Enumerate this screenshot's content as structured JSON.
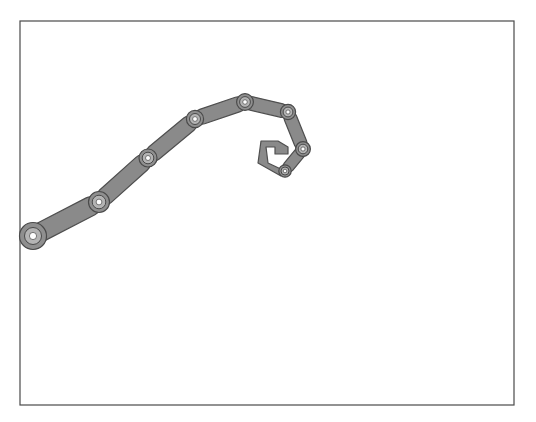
{
  "canvas": {
    "width": 536,
    "height": 422,
    "background_color": "#ffffff",
    "label": "robot-arm-viewport"
  },
  "frame": {
    "name": "viewport-border",
    "x": 20,
    "y": 21,
    "width": 494,
    "height": 384,
    "stroke_color": "#4a4a4a",
    "stroke_width": 1.2,
    "fill_color": "#ffffff"
  },
  "style": {
    "link_fill": "#8a8a8a",
    "link_stroke": "#4f4f4f",
    "link_stroke_width": 1.2,
    "joint_outer_fill": "#8f8f8f",
    "joint_outer_stroke": "#4a4a4a",
    "joint_mid_fill": "#b4b4b4",
    "joint_hub_fill": "#ffffff",
    "joint_hub_stroke": "#5a5a5a",
    "gripper_fill": "#8a8a8a",
    "gripper_stroke": "#4f4f4f"
  },
  "mechanism": {
    "name": "serial-robot-arm",
    "type": "planar articulated linkage",
    "link_half_width": 7.5,
    "joint_count": 8,
    "joints": [
      {
        "id": "joint-base",
        "label": "J0",
        "x": 33,
        "y": 236,
        "outer_r": 13.5,
        "mid_r": 8.5,
        "hub_r": 3.6
      },
      {
        "id": "joint-1",
        "label": "J1",
        "x": 99,
        "y": 202,
        "outer_r": 10.5,
        "mid_r": 6.8,
        "hub_r": 2.9
      },
      {
        "id": "joint-2",
        "label": "J2",
        "x": 148,
        "y": 158,
        "outer_r": 9.0,
        "mid_r": 5.8,
        "hub_r": 2.5
      },
      {
        "id": "joint-3",
        "label": "J3",
        "x": 195,
        "y": 119,
        "outer_r": 8.6,
        "mid_r": 5.5,
        "hub_r": 2.4
      },
      {
        "id": "joint-4-apex",
        "label": "J4",
        "x": 245,
        "y": 102,
        "outer_r": 8.4,
        "mid_r": 5.4,
        "hub_r": 2.3
      },
      {
        "id": "joint-5",
        "label": "J5",
        "x": 288,
        "y": 112,
        "outer_r": 7.6,
        "mid_r": 4.9,
        "hub_r": 2.1
      },
      {
        "id": "joint-6",
        "label": "J6",
        "x": 303,
        "y": 149,
        "outer_r": 7.4,
        "mid_r": 4.8,
        "hub_r": 2.1
      },
      {
        "id": "joint-7-wrist",
        "label": "J7",
        "x": 285,
        "y": 171,
        "outer_r": 6.2,
        "mid_r": 4.0,
        "hub_r": 1.8
      }
    ],
    "links": [
      {
        "id": "link-0",
        "label": "L0",
        "from": "joint-base",
        "to": "joint-1",
        "half_width": 9.5
      },
      {
        "id": "link-1",
        "label": "L1",
        "from": "joint-1",
        "to": "joint-2",
        "half_width": 8.5
      },
      {
        "id": "link-2",
        "label": "L2",
        "from": "joint-2",
        "to": "joint-3",
        "half_width": 8.0
      },
      {
        "id": "link-3",
        "label": "L3",
        "from": "joint-3",
        "to": "joint-4-apex",
        "half_width": 7.6
      },
      {
        "id": "link-4",
        "label": "L4",
        "from": "joint-4-apex",
        "to": "joint-5",
        "half_width": 6.8
      },
      {
        "id": "link-5",
        "label": "L5",
        "from": "joint-5",
        "to": "joint-6",
        "half_width": 6.4
      },
      {
        "id": "link-6",
        "label": "L6",
        "from": "joint-6",
        "to": "joint-7-wrist",
        "half_width": 5.6
      }
    ],
    "gripper": {
      "id": "gripper-hook",
      "label": "end-effector",
      "attached_to": "joint-7-wrist",
      "outline": "M 285 171 L 268 163 L 266 147 L 275 147 L 275 154 L 288 154 L 288 147 L 278 141 L 261 141 L 258 163 L 281 176 Z",
      "stroke_color": "#4f4f4f",
      "fill_color": "#8a8a8a"
    }
  }
}
